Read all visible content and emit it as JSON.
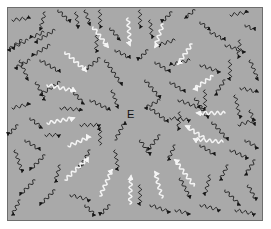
{
  "diagram": {
    "center_label": "E",
    "center": [
      131,
      114
    ],
    "colors": {
      "background": "#a9a9a9",
      "frame_border": "#6e6e6e",
      "black_arrow": "#161616",
      "white_arrow": "#f4f4f4"
    },
    "white_arrows": [
      {
        "from": [
          65,
          52
        ],
        "to": [
          86,
          71
        ]
      },
      {
        "from": [
          93,
          27
        ],
        "to": [
          108,
          47
        ]
      },
      {
        "from": [
          128,
          18
        ],
        "to": [
          130,
          45
        ]
      },
      {
        "from": [
          163,
          24
        ],
        "to": [
          155,
          47
        ]
      },
      {
        "from": [
          192,
          44
        ],
        "to": [
          178,
          64
        ]
      },
      {
        "from": [
          213,
          76
        ],
        "to": [
          194,
          89
        ]
      },
      {
        "from": [
          225,
          113
        ],
        "to": [
          197,
          113
        ]
      },
      {
        "from": [
          223,
          142
        ],
        "to": [
          194,
          139
        ]
      },
      {
        "from": [
          47,
          85
        ],
        "to": [
          75,
          91
        ]
      },
      {
        "from": [
          47,
          123
        ],
        "to": [
          74,
          118
        ]
      },
      {
        "from": [
          68,
          146
        ],
        "to": [
          90,
          137
        ]
      },
      {
        "from": [
          65,
          180
        ],
        "to": [
          88,
          158
        ]
      },
      {
        "from": [
          100,
          196
        ],
        "to": [
          112,
          170
        ]
      },
      {
        "from": [
          130,
          204
        ],
        "to": [
          131,
          176
        ]
      },
      {
        "from": [
          204,
          138
        ],
        "to": [
          186,
          126
        ]
      },
      {
        "from": [
          194,
          186
        ],
        "to": [
          175,
          160
        ]
      },
      {
        "from": [
          162,
          198
        ],
        "to": [
          155,
          172
        ]
      }
    ],
    "black_arrows": [
      {
        "from": [
          12,
          20
        ],
        "to": [
          30,
          18
        ]
      },
      {
        "from": [
          22,
          40
        ],
        "to": [
          8,
          50
        ]
      },
      {
        "from": [
          45,
          12
        ],
        "to": [
          40,
          30
        ]
      },
      {
        "from": [
          58,
          10
        ],
        "to": [
          70,
          22
        ]
      },
      {
        "from": [
          76,
          12
        ],
        "to": [
          78,
          28
        ]
      },
      {
        "from": [
          44,
          32
        ],
        "to": [
          30,
          38
        ]
      },
      {
        "from": [
          30,
          60
        ],
        "to": [
          15,
          68
        ]
      },
      {
        "from": [
          28,
          40
        ],
        "to": [
          12,
          48
        ]
      },
      {
        "from": [
          55,
          30
        ],
        "to": [
          35,
          42
        ]
      },
      {
        "from": [
          50,
          45
        ],
        "to": [
          32,
          56
        ]
      },
      {
        "from": [
          20,
          60
        ],
        "to": [
          28,
          80
        ]
      },
      {
        "from": [
          40,
          60
        ],
        "to": [
          60,
          72
        ]
      },
      {
        "from": [
          36,
          82
        ],
        "to": [
          45,
          100
        ]
      },
      {
        "from": [
          60,
          82
        ],
        "to": [
          40,
          95
        ]
      },
      {
        "from": [
          85,
          10
        ],
        "to": [
          90,
          25
        ]
      },
      {
        "from": [
          100,
          10
        ],
        "to": [
          100,
          28
        ]
      },
      {
        "from": [
          110,
          28
        ],
        "to": [
          120,
          40
        ]
      },
      {
        "from": [
          97,
          35
        ],
        "to": [
          96,
          52
        ]
      },
      {
        "from": [
          115,
          50
        ],
        "to": [
          130,
          58
        ]
      },
      {
        "from": [
          100,
          58
        ],
        "to": [
          85,
          70
        ]
      },
      {
        "from": [
          70,
          88
        ],
        "to": [
          84,
          104
        ]
      },
      {
        "from": [
          105,
          60
        ],
        "to": [
          122,
          85
        ]
      },
      {
        "from": [
          140,
          10
        ],
        "to": [
          140,
          28
        ]
      },
      {
        "from": [
          150,
          20
        ],
        "to": [
          152,
          38
        ]
      },
      {
        "from": [
          172,
          12
        ],
        "to": [
          162,
          22
        ]
      },
      {
        "from": [
          195,
          10
        ],
        "to": [
          185,
          18
        ]
      },
      {
        "from": [
          200,
          22
        ],
        "to": [
          210,
          30
        ]
      },
      {
        "from": [
          230,
          15
        ],
        "to": [
          248,
          12
        ]
      },
      {
        "from": [
          245,
          25
        ],
        "to": [
          255,
          30
        ]
      },
      {
        "from": [
          175,
          40
        ],
        "to": [
          158,
          45
        ]
      },
      {
        "from": [
          190,
          60
        ],
        "to": [
          170,
          65
        ]
      },
      {
        "from": [
          210,
          32
        ],
        "to": [
          225,
          40
        ]
      },
      {
        "from": [
          240,
          40
        ],
        "to": [
          238,
          58
        ]
      },
      {
        "from": [
          225,
          45
        ],
        "to": [
          245,
          52
        ]
      },
      {
        "from": [
          148,
          50
        ],
        "to": [
          138,
          60
        ]
      },
      {
        "from": [
          155,
          62
        ],
        "to": [
          170,
          72
        ]
      },
      {
        "from": [
          145,
          80
        ],
        "to": [
          160,
          98
        ]
      },
      {
        "from": [
          170,
          82
        ],
        "to": [
          185,
          92
        ]
      },
      {
        "from": [
          200,
          65
        ],
        "to": [
          220,
          72
        ]
      },
      {
        "from": [
          230,
          60
        ],
        "to": [
          230,
          80
        ]
      },
      {
        "from": [
          250,
          60
        ],
        "to": [
          258,
          80
        ]
      },
      {
        "from": [
          240,
          88
        ],
        "to": [
          258,
          92
        ]
      },
      {
        "from": [
          225,
          80
        ],
        "to": [
          215,
          95
        ]
      },
      {
        "from": [
          160,
          100
        ],
        "to": [
          145,
          108
        ]
      },
      {
        "from": [
          178,
          100
        ],
        "to": [
          200,
          108
        ]
      },
      {
        "from": [
          235,
          95
        ],
        "to": [
          240,
          118
        ]
      },
      {
        "from": [
          250,
          110
        ],
        "to": [
          255,
          125
        ]
      },
      {
        "from": [
          205,
          90
        ],
        "to": [
          205,
          110
        ]
      },
      {
        "from": [
          112,
          90
        ],
        "to": [
          118,
          108
        ]
      },
      {
        "from": [
          90,
          100
        ],
        "to": [
          110,
          110
        ]
      },
      {
        "from": [
          12,
          108
        ],
        "to": [
          30,
          104
        ]
      },
      {
        "from": [
          18,
          125
        ],
        "to": [
          8,
          135
        ]
      },
      {
        "from": [
          30,
          118
        ],
        "to": [
          42,
          128
        ]
      },
      {
        "from": [
          25,
          140
        ],
        "to": [
          40,
          150
        ]
      },
      {
        "from": [
          45,
          135
        ],
        "to": [
          60,
          135
        ]
      },
      {
        "from": [
          80,
          125
        ],
        "to": [
          100,
          125
        ]
      },
      {
        "from": [
          60,
          108
        ],
        "to": [
          82,
          110
        ]
      },
      {
        "from": [
          100,
          145
        ],
        "to": [
          100,
          128
        ]
      },
      {
        "from": [
          115,
          140
        ],
        "to": [
          125,
          122
        ]
      },
      {
        "from": [
          150,
          108
        ],
        "to": [
          168,
          122
        ]
      },
      {
        "from": [
          160,
          135
        ],
        "to": [
          148,
          150
        ]
      },
      {
        "from": [
          170,
          118
        ],
        "to": [
          190,
          120
        ]
      },
      {
        "from": [
          195,
          98
        ],
        "to": [
          208,
          118
        ]
      },
      {
        "from": [
          212,
          122
        ],
        "to": [
          228,
          140
        ]
      },
      {
        "from": [
          238,
          125
        ],
        "to": [
          255,
          120
        ]
      },
      {
        "from": [
          245,
          140
        ],
        "to": [
          258,
          148
        ]
      },
      {
        "from": [
          230,
          150
        ],
        "to": [
          248,
          158
        ]
      },
      {
        "from": [
          255,
          160
        ],
        "to": [
          245,
          175
        ]
      },
      {
        "from": [
          200,
          145
        ],
        "to": [
          215,
          155
        ]
      },
      {
        "from": [
          175,
          145
        ],
        "to": [
          168,
          160
        ]
      },
      {
        "from": [
          140,
          140
        ],
        "to": [
          150,
          155
        ]
      },
      {
        "from": [
          115,
          150
        ],
        "to": [
          118,
          170
        ]
      },
      {
        "from": [
          90,
          150
        ],
        "to": [
          80,
          168
        ]
      },
      {
        "from": [
          45,
          155
        ],
        "to": [
          30,
          170
        ]
      },
      {
        "from": [
          15,
          150
        ],
        "to": [
          22,
          172
        ]
      },
      {
        "from": [
          60,
          165
        ],
        "to": [
          55,
          182
        ]
      },
      {
        "from": [
          35,
          180
        ],
        "to": [
          20,
          195
        ]
      },
      {
        "from": [
          55,
          190
        ],
        "to": [
          40,
          205
        ]
      },
      {
        "from": [
          70,
          195
        ],
        "to": [
          90,
          200
        ]
      },
      {
        "from": [
          20,
          200
        ],
        "to": [
          12,
          215
        ]
      },
      {
        "from": [
          85,
          205
        ],
        "to": [
          95,
          215
        ]
      },
      {
        "from": [
          110,
          205
        ],
        "to": [
          100,
          215
        ]
      },
      {
        "from": [
          140,
          185
        ],
        "to": [
          140,
          205
        ]
      },
      {
        "from": [
          150,
          205
        ],
        "to": [
          170,
          212
        ]
      },
      {
        "from": [
          180,
          178
        ],
        "to": [
          190,
          198
        ]
      },
      {
        "from": [
          210,
          175
        ],
        "to": [
          205,
          195
        ]
      },
      {
        "from": [
          225,
          190
        ],
        "to": [
          240,
          205
        ]
      },
      {
        "from": [
          248,
          185
        ],
        "to": [
          256,
          200
        ]
      },
      {
        "from": [
          235,
          210
        ],
        "to": [
          255,
          214
        ]
      },
      {
        "from": [
          200,
          205
        ],
        "to": [
          220,
          210
        ]
      },
      {
        "from": [
          175,
          210
        ],
        "to": [
          190,
          214
        ]
      },
      {
        "from": [
          228,
          165
        ],
        "to": [
          220,
          180
        ]
      },
      {
        "from": [
          180,
          112
        ],
        "to": [
          178,
          130
        ]
      }
    ]
  }
}
